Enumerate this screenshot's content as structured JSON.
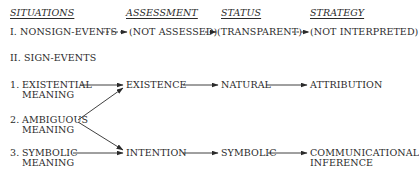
{
  "headers": {
    "situations": "SITUATIONS",
    "assessment": "ASSESSMENT",
    "status": "STATUS",
    "strategy": "STRATEGY"
  },
  "nonsign": {
    "situation": "I. NONSIGN-EVENTS",
    "assessment": "(NOT ASSESSED)",
    "status": "(TRANSPARENT)",
    "strategy": "(NOT INTERPRETED)"
  },
  "sign": {
    "title": "II. SIGN-EVENTS",
    "situations": [
      {
        "num": "1.",
        "line1": "EXISTENTIAL",
        "line2": "MEANING"
      },
      {
        "num": "2.",
        "line1": "AMBIGUOUS",
        "line2": "MEANING"
      },
      {
        "num": "3.",
        "line1": "SYMBOLIC",
        "line2": "MEANING"
      }
    ],
    "existence_row": {
      "assessment": "EXISTENCE",
      "status": "NATURAL",
      "strategy": "ATTRIBUTION"
    },
    "intention_row": {
      "assessment": "INTENTION",
      "status": "SYMBOLIC",
      "strategy_line1": "COMMUNICATIONAL",
      "strategy_line2": "INFERENCE"
    }
  }
}
